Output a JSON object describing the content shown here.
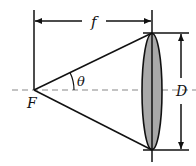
{
  "diagram": {
    "labels": {
      "focal_length": "f",
      "focal_point": "F",
      "angle": "θ",
      "diameter": "D"
    },
    "colors": {
      "lens_fill": "#a9a9a9",
      "line": "#111111",
      "axis": "#888888"
    }
  }
}
